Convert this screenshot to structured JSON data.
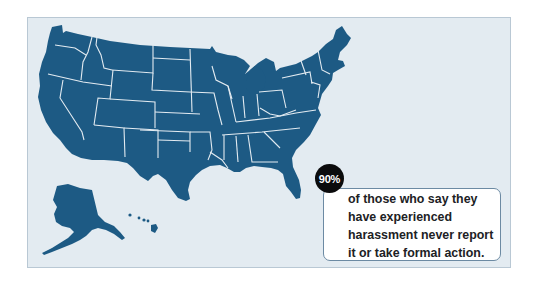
{
  "map": {
    "title": "United States map",
    "land_color": "#1d5a84",
    "border_color": "#e3ebf1",
    "background_color": "#e3ebf1",
    "regions": [
      "Contiguous United States",
      "Alaska",
      "Hawaii"
    ]
  },
  "callout": {
    "stat": "90%",
    "lines": [
      "of those who say they",
      "have experienced",
      "harassment never report",
      "it or take formal action."
    ]
  }
}
